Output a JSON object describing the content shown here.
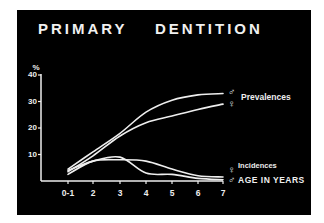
{
  "chart_data": {
    "type": "line",
    "title_parts": [
      "PRIMARY",
      "DENTITION"
    ],
    "xlabel": "AGE IN YEARS",
    "ylabel": "%",
    "categories": [
      "0-1",
      "2",
      "3",
      "4",
      "5",
      "6",
      "7"
    ],
    "yticks": [
      "10",
      "20",
      "30",
      "40"
    ],
    "ylim": [
      0,
      40
    ],
    "grid": false,
    "legend_position": "right, inline at line ends",
    "series": [
      {
        "name": "Prevalences ♂",
        "group": "Prevalences",
        "sex": "male",
        "values": [
          4.5,
          11,
          18,
          26,
          30.5,
          32.5,
          33
        ]
      },
      {
        "name": "Prevalences ♀",
        "group": "Prevalences",
        "sex": "female",
        "values": [
          3.5,
          9.5,
          17,
          22,
          24.5,
          27,
          29
        ]
      },
      {
        "name": "Incidences ♀",
        "group": "Incidences",
        "sex": "female",
        "values": [
          4,
          7.5,
          9,
          3,
          2.5,
          1,
          0.5
        ]
      },
      {
        "name": "Incidences ♂",
        "group": "Incidences",
        "sex": "male",
        "values": [
          2.5,
          7.5,
          8,
          7.5,
          4.5,
          2,
          1.5
        ]
      }
    ],
    "annotations": [
      "Prevalences",
      "Incidences",
      "♂",
      "♀"
    ]
  },
  "labels": {
    "title_left": "PRIMARY",
    "title_right": "DENTITION",
    "y_unit": "%",
    "prevalences": "Prevalences",
    "incidences": "Incidences",
    "x_axis": "AGE IN YEARS",
    "male_symbol": "♂",
    "female_symbol": "♀"
  },
  "colors": {
    "background": "#000000",
    "foreground": "#eeeeee",
    "page": "#ffffff"
  }
}
